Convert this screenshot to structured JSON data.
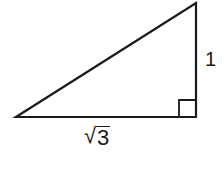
{
  "diagram": {
    "type": "right-triangle",
    "stroke_color": "#1a1a1a",
    "background": "#ffffff",
    "vertices": {
      "left": {
        "x": 16,
        "y": 117
      },
      "right_angle": {
        "x": 196,
        "y": 117
      },
      "top": {
        "x": 196,
        "y": 3
      }
    },
    "right_angle_marker": {
      "x": 178,
      "y": 100,
      "size": 18
    },
    "labels": {
      "vertical_side": "1",
      "horizontal_side": {
        "radical": "√",
        "radicand": "3"
      }
    }
  }
}
